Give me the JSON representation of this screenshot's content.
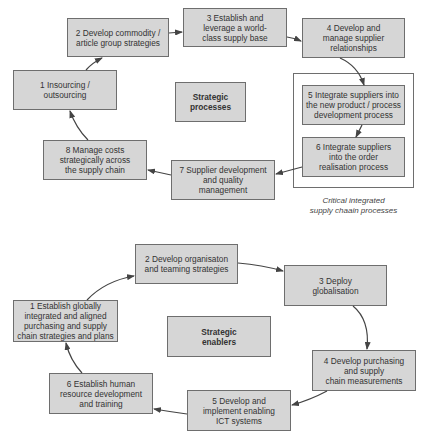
{
  "strategic_processes": {
    "center_label": "Strategic\nprocesses",
    "boxes": [
      {
        "id": 1,
        "label": "1 Insourcing /\noutsourcing"
      },
      {
        "id": 2,
        "label": "2 Develop commodity /\narticle group strategies"
      },
      {
        "id": 3,
        "label": "3 Establish and\nleverage a world-\nclass supply base"
      },
      {
        "id": 4,
        "label": "4 Develop and\nmanage supplier\nrelationships"
      },
      {
        "id": 5,
        "label": "5 Integrate suppliers  into\nthe new product / process\ndevelopment process"
      },
      {
        "id": 6,
        "label": "6 Integrate suppliers\ninto the order\nrealisation process"
      },
      {
        "id": 7,
        "label": "7 Supplier development\nand quality\nmanagement"
      },
      {
        "id": 8,
        "label": "8 Manage costs\nstrategically across\nthe supply chain"
      }
    ],
    "frame_caption": "Critical integrated\nsupply chaain processes"
  },
  "strategic_enablers": {
    "center_label": "Strategic\nenablers",
    "boxes": [
      {
        "id": 1,
        "label": "1 Establish globally\nintegrated and aligned\npurchasing and supply\nchain strategies and plans"
      },
      {
        "id": 2,
        "label": "2 Develop organisaton\nand teaming strategies"
      },
      {
        "id": 3,
        "label": "3 Deploy\nglobalisation"
      },
      {
        "id": 4,
        "label": "4 Develop purchasing\nand supply\nchain measurements"
      },
      {
        "id": 5,
        "label": "5 Develop and\nimplement enabling\nICT systems"
      },
      {
        "id": 6,
        "label": "6 Establish human\nresource development\nand training"
      }
    ]
  },
  "colors": {
    "box_fill": "#d6d6d6",
    "box_border": "#6e6e6e",
    "arrow": "#444444"
  }
}
